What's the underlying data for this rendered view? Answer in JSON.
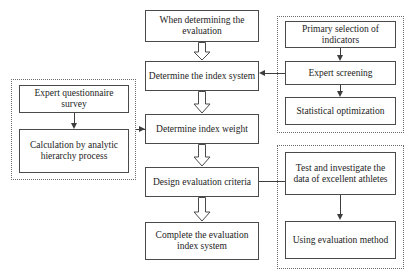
{
  "diagram": {
    "background_color": "#ffffff",
    "stroke_color": "#4a4a4a",
    "text_color": "#1c1c1c"
  },
  "main_flow": {
    "nodes": [
      {
        "id": "start",
        "label": "When determining the evaluation"
      },
      {
        "id": "index_sys",
        "label": "Determine the index system"
      },
      {
        "id": "index_wt",
        "label": "Determine index weight"
      },
      {
        "id": "criteria",
        "label": "Design evaluation criteria"
      },
      {
        "id": "complete",
        "label": "Complete the evaluation index system"
      }
    ]
  },
  "right_top_group": {
    "nodes": [
      {
        "id": "primary_sel",
        "label": "Primary selection of indicators"
      },
      {
        "id": "expert_scr",
        "label": "Expert screening"
      },
      {
        "id": "stat_opt",
        "label": "Statistical optimization"
      }
    ]
  },
  "left_group": {
    "nodes": [
      {
        "id": "questionnaire",
        "label": "Expert questionnaire survey"
      },
      {
        "id": "ahp",
        "label": "Calculation by analytic hierarchy process"
      }
    ]
  },
  "right_bottom_group": {
    "nodes": [
      {
        "id": "test_data",
        "label": "Test and investigate the data of excellent athletes"
      },
      {
        "id": "use_method",
        "label": "Using evaluation method"
      }
    ]
  }
}
